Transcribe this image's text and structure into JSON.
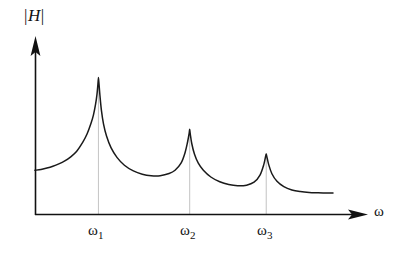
{
  "figure": {
    "background_color": "#ffffff",
    "curve_color": "#1a1a1a",
    "axis_color": "#111111",
    "dropline_color": "#c8c8c8"
  },
  "axes": {
    "y_label_prefix": "|",
    "y_label_symbol": "H",
    "y_label_suffix": "|",
    "x_label": "ω"
  },
  "ticks": [
    {
      "name": "omega-1",
      "base": "ω",
      "sub": "1"
    },
    {
      "name": "omega-2",
      "base": "ω",
      "sub": "2"
    },
    {
      "name": "omega-3",
      "base": "ω",
      "sub": "3"
    }
  ],
  "chart_data": {
    "type": "line",
    "title": "",
    "subtitle": "",
    "xlabel": "ω",
    "ylabel": "|H|",
    "grid": false,
    "legend": null,
    "axis_arrows": {
      "x": "right",
      "y": "up"
    },
    "xlim": [
      0,
      1
    ],
    "ylim": [
      0,
      1
    ],
    "x_tick_labels": [
      "ω₁",
      "ω₂",
      "ω₃"
    ],
    "x_tick_positions": [
      0.213,
      0.519,
      0.776
    ],
    "y_tick_labels": [],
    "annotations": [
      {
        "name": "resonance-peak-1",
        "x": 0.213,
        "y": 0.922,
        "label": "ω₁"
      },
      {
        "name": "resonance-peak-2",
        "x": 0.519,
        "y": 0.575,
        "label": "ω₂"
      },
      {
        "name": "resonance-peak-3",
        "x": 0.776,
        "y": 0.409,
        "label": "ω₃"
      }
    ],
    "droplines": [
      {
        "name": "dropline-omega-1",
        "x": 0.213,
        "y_top": 0.922
      },
      {
        "name": "dropline-omega-2",
        "x": 0.519,
        "y_top": 0.575
      },
      {
        "name": "dropline-omega-3",
        "x": 0.776,
        "y_top": 0.409
      }
    ],
    "series": [
      {
        "name": "magnitude-response",
        "x": [
          0.0,
          0.02,
          0.04,
          0.06,
          0.08,
          0.1,
          0.12,
          0.14,
          0.16,
          0.175,
          0.188,
          0.196,
          0.203,
          0.208,
          0.211,
          0.213,
          0.215,
          0.218,
          0.223,
          0.23,
          0.24,
          0.255,
          0.275,
          0.3,
          0.33,
          0.36,
          0.39,
          0.42,
          0.45,
          0.47,
          0.49,
          0.503,
          0.512,
          0.517,
          0.519,
          0.521,
          0.526,
          0.535,
          0.548,
          0.565,
          0.59,
          0.62,
          0.65,
          0.68,
          0.71,
          0.735,
          0.755,
          0.768,
          0.774,
          0.776,
          0.778,
          0.784,
          0.795,
          0.812,
          0.835,
          0.862,
          0.89,
          0.92,
          0.95,
          0.975,
          1.0
        ],
        "y": [
          0.3,
          0.306,
          0.315,
          0.327,
          0.343,
          0.363,
          0.39,
          0.428,
          0.487,
          0.545,
          0.615,
          0.67,
          0.74,
          0.81,
          0.875,
          0.922,
          0.875,
          0.8,
          0.7,
          0.61,
          0.53,
          0.452,
          0.387,
          0.334,
          0.296,
          0.274,
          0.264,
          0.264,
          0.278,
          0.3,
          0.348,
          0.415,
          0.49,
          0.545,
          0.575,
          0.545,
          0.48,
          0.41,
          0.348,
          0.3,
          0.255,
          0.223,
          0.204,
          0.196,
          0.2,
          0.22,
          0.268,
          0.34,
          0.395,
          0.409,
          0.392,
          0.34,
          0.277,
          0.226,
          0.19,
          0.168,
          0.157,
          0.151,
          0.149,
          0.148,
          0.148
        ]
      }
    ]
  }
}
